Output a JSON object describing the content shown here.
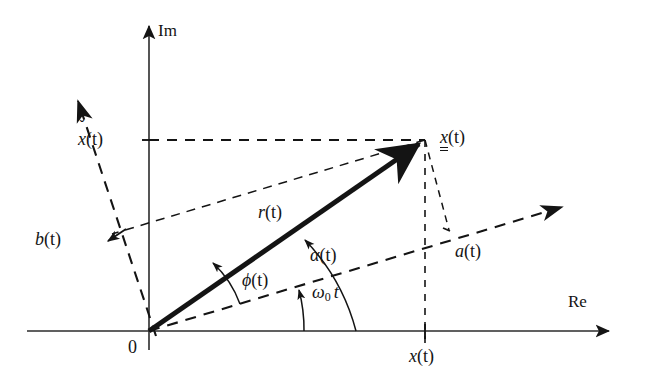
{
  "figure": {
    "type": "phasor-diagram",
    "background_color": "#ffffff",
    "ink_color": "#141414"
  },
  "axes": {
    "real": {
      "label": "Re",
      "label_x": 568,
      "label_y": 293
    },
    "imaginary": {
      "label": "Im",
      "label_x": 158,
      "label_y": 22
    },
    "origin": {
      "label": "0",
      "label_x": 128,
      "label_y": 338,
      "x": 149,
      "y": 331
    }
  },
  "labels": {
    "phasor_tip": {
      "text": "x",
      "suffix": "(t)",
      "name": "complex-phasor",
      "x": 440,
      "y": 128,
      "style": "double-underline-italic"
    },
    "magnitude": {
      "text": "r",
      "suffix": "(t)",
      "name": "phasor-magnitude",
      "x": 258,
      "y": 203
    },
    "phase_phi": {
      "text": "ϕ",
      "suffix": "(t)",
      "name": "instantaneous-phase",
      "x": 242,
      "y": 271
    },
    "phase_alpha": {
      "text": "α",
      "suffix": "(t)",
      "name": "total-angle",
      "x": 310,
      "y": 246
    },
    "carrier_angle": {
      "text": "ω",
      "subscript": "0",
      "suffix": "t",
      "name": "carrier-angle",
      "x": 312,
      "y": 283
    },
    "real_projection": {
      "text": "x",
      "suffix": "(t)",
      "name": "real-part",
      "x": 409,
      "y": 347
    },
    "imag_projection": {
      "text": "x",
      "accent": "ˇ",
      "suffix": "(t)",
      "name": "imaginary-part",
      "x": 78,
      "y": 130
    },
    "a_component": {
      "text": "a",
      "suffix": "(t)",
      "name": "in-phase-component",
      "x": 455,
      "y": 242
    },
    "b_component": {
      "text": "b",
      "suffix": "(t)",
      "name": "quadrature-component",
      "x": 35,
      "y": 230
    }
  },
  "geometry": {
    "origin": [
      149,
      331
    ],
    "phasor_tip": [
      425,
      140
    ],
    "im_axis_top": [
      149,
      22
    ],
    "im_axis_bottom": [
      149,
      350
    ],
    "re_axis_left": [
      27,
      331
    ],
    "re_axis_right": [
      615,
      331
    ],
    "a_axis_tip": [
      570,
      204
    ],
    "b_axis_tip": [
      72,
      94
    ],
    "a_foot": [
      449,
      230
    ],
    "b_foot": [
      111,
      241
    ],
    "imag_tick_y": 140,
    "real_tick_x": 425
  }
}
